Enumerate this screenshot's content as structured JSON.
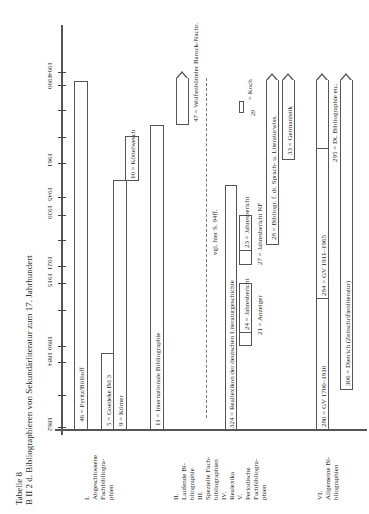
{
  "title": {
    "line1": "Tabelle 8",
    "line2": "B II 2 d. Bibliographieren von Sekundärliteratur zum 17. Jahrhundert"
  },
  "axis": {
    "ticks": [
      {
        "year": "1862",
        "y": 427
      },
      {
        "year": "1884",
        "y": 362
      },
      {
        "year": "1890",
        "y": 346
      },
      {
        "year": "1915",
        "y": 283
      },
      {
        "year": "1921",
        "y": 266
      },
      {
        "year": "1939",
        "y": 215
      },
      {
        "year": "1945",
        "y": 197
      },
      {
        "year": "1961",
        "y": 163
      },
      {
        "year": "1990",
        "y": 85
      },
      {
        "year": "1994",
        "y": 72
      }
    ],
    "minor_ticks": [
      110,
      137,
      240,
      310,
      395
    ]
  },
  "categories": [
    {
      "label": "I.\nAbgeschlossene\nFachbibliogra-\nphien",
      "x": 83
    },
    {
      "label": "II.\nLaufende Bi-\nbliographie\nIII.\nSpezielle Fach-\nbibliographien\nIV.\nRealexika\nV.\nPeriodische\nFachbibliogra-\nphien",
      "x": 172
    },
    {
      "label": "VI.\nAllgemeine Bi-\nbliographien",
      "x": 316
    }
  ],
  "chart_data": {
    "type": "table",
    "xlabel": "Jahr",
    "ylabel": "Bibliographien",
    "axis_ticks": [
      "1862",
      "1884",
      "1890",
      "1915",
      "1921",
      "1939",
      "1945",
      "1961",
      "1990",
      "1994"
    ],
    "series": [
      {
        "group": "I. Abgeschlossene Fachbibliographien",
        "name": "46 = Pyritz/Bölhoff",
        "start": 1862,
        "end": 1990
      },
      {
        "group": "I. Abgeschlossene Fachbibliographien",
        "name": "5 = Goedeke Bd 3",
        "start": 1862,
        "end": 1887
      },
      {
        "group": "I. Abgeschlossene Fachbibliographien",
        "name": "9 = Körner",
        "start": 1862,
        "end": 1950
      },
      {
        "group": "I. Abgeschlossene Fachbibliographien",
        "name": "10 = Köttelwesch",
        "start": 1945,
        "end": 1961
      },
      {
        "group": "II. Laufende Bibliographie",
        "name": "11 = Internationale Bibliographie",
        "start": 1862,
        "end": 1990
      },
      {
        "group": "III. Spezielle Fachbibliographien",
        "name": "47 = Wolfenbütteler Barock-Nachr.",
        "start": 1960,
        "end": 1994,
        "open_end": true
      },
      {
        "group": "III. Spezielle Fachbibliographien",
        "name": "vgl. hier S. 94ff.",
        "start": 1865,
        "end": 1985,
        "dashed": true
      },
      {
        "group": "IV. Reallexika",
        "name": "324 = Reallexikon der deutschen Literaturgeschichte",
        "start": 1862,
        "end": 1959
      },
      {
        "group": "V. Periodische Fachbibliographien",
        "name": "24 = Jahresbericht",
        "start": 1890,
        "end": 1915
      },
      {
        "group": "V. Periodische Fachbibliographien",
        "name": "21 = Anzeiger",
        "start": 1890,
        "end": 1905,
        "unboxed": true
      },
      {
        "group": "V. Periodische Fachbibliographien",
        "name": "23 = Jahresbericht",
        "start": 1924,
        "end": 1939
      },
      {
        "group": "V. Periodische Fachbibliographien",
        "name": "27 = Jahresbericht NF",
        "start": 1924,
        "end": 1960
      },
      {
        "group": "V. Periodische Fachbibliographien",
        "name": "Koch",
        "start": 1962,
        "end": 1966,
        "note": "29"
      },
      {
        "group": "V. Periodische Fachbibliographien",
        "name": "28 = Bibliogr. f. dt. Sprach- u. Literaturwiss.",
        "start": 1945,
        "end": 1994,
        "open_end": true
      },
      {
        "group": "V. Periodische Fachbibliographien",
        "name": "33 = Germanistik",
        "start": 1960,
        "end": 1994,
        "open_end": true
      },
      {
        "group": "VI. Allgemeine Bibliographien",
        "name": "280 = GV 1700–1910",
        "start": 1862,
        "end": 1910
      },
      {
        "group": "VI. Allgemeine Bibliographien",
        "name": "284 = GV 1911–1965",
        "start": 1911,
        "end": 1965
      },
      {
        "group": "VI. Allgemeine Bibliographien",
        "name": "295 = Dt. Bibliographie etc.",
        "start": 1945,
        "end": 1994,
        "open_end": true
      },
      {
        "group": "VI. Allgemeine Bibliographien",
        "name": "306 = Dietrich (Zeitschriftenliteratur)",
        "start": 1897,
        "end": 1994,
        "open_end": true
      }
    ]
  },
  "bars": {
    "b46": "46 = Pyritz/Bölhoff",
    "b5": "5 = Goedeke Bd 3",
    "b9": "9 = Körner",
    "b10": "10 = Köttelwesch",
    "b11": "11 = Internationale Bibliographie",
    "b47": "47 = Wolfenbütteler Barock-Nachr.",
    "vgl": "vgl. hier S. 94ff.",
    "b324": "324 = Reallexikon der deutschen Literaturgeschichte",
    "b24": "24 = Jahresbericht",
    "b21": "21 = Anzeiger",
    "b23": "23 = Jahresbericht",
    "b27": "27 = Jahresbericht NF",
    "koch": "= Koch",
    "koch_num": "29",
    "b28": "28 = Bibliogr. f. dt. Sprach- u. Literaturwiss.",
    "b33": "33 = Germanistik",
    "b280": "280 = GV 1700–1910",
    "b284": "284 = GV 1911–1965",
    "b295": "295 = Dt. Bibliographie etc.",
    "b306": "306 = Dietrich (Zeitschriftenliteratur)"
  }
}
